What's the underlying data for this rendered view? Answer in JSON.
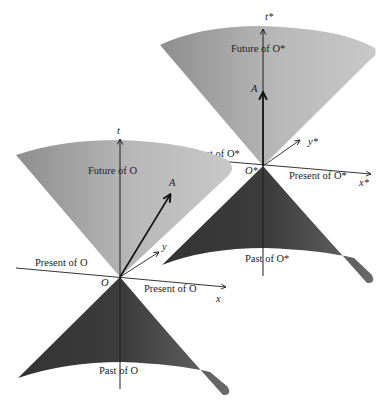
{
  "figure": {
    "type": "spacetime-light-cone-diagram",
    "colors": {
      "background": "#ffffff",
      "future_cone_light": "#c4c4c4",
      "future_cone_dark": "#8e8e8e",
      "past_cone_dark": "#3a3a3a",
      "past_cone_light": "#6e6e6e",
      "axis_line": "#1e1e1e"
    },
    "left_frame": {
      "observer": "O",
      "time_axis_label": "t",
      "x_axis_label": "x",
      "y_axis_label": "y",
      "event_label": "A",
      "future_label": "Future of O",
      "past_label": "Past of O",
      "present_left_label": "Present of O",
      "present_right_label": "Present of O"
    },
    "right_frame": {
      "observer": "O*",
      "time_axis_label": "t*",
      "x_axis_label": "x*",
      "y_axis_label": "y*",
      "event_label": "A",
      "future_label": "Future of O*",
      "past_label": "Past of O*",
      "present_left_label": "Present of O*",
      "present_right_label": "Present of O*"
    }
  }
}
